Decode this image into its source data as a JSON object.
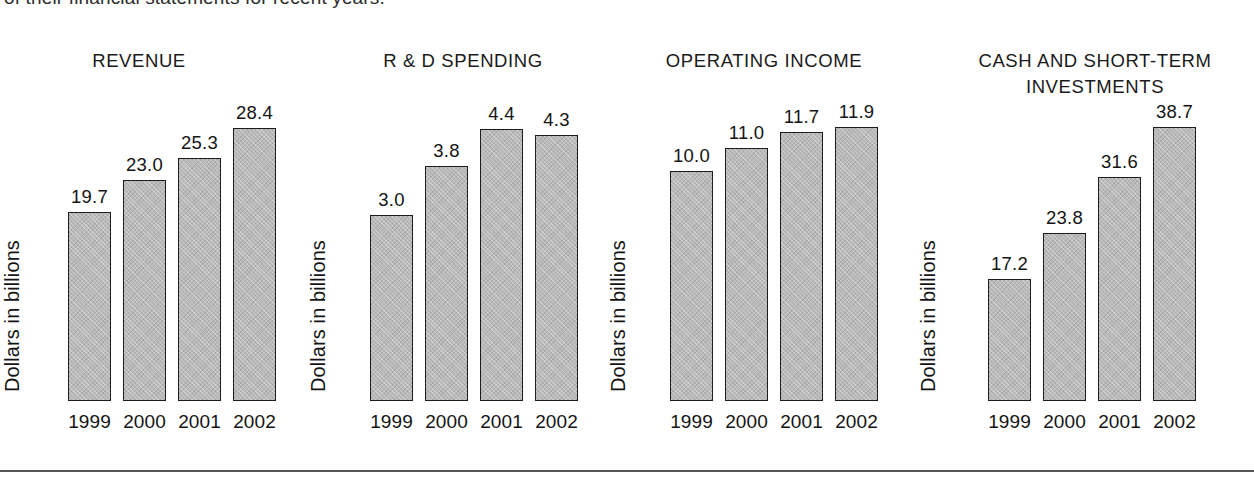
{
  "page": {
    "intro_text": "of their financial statements for recent years.",
    "bar_fill_color": "#b9b9b9",
    "bar_outline_color": "#1c1c1c",
    "background_color": "#ffffff",
    "rule_color": "#555555"
  },
  "chart_data": [
    {
      "type": "bar",
      "title": "REVENUE",
      "categories": [
        "1999",
        "2000",
        "2001",
        "2002"
      ],
      "values": [
        19.7,
        23.0,
        25.3,
        28.4
      ],
      "labels": [
        "19.7",
        "23.0",
        "25.3",
        "28.4"
      ],
      "xlabel": "",
      "ylabel": "Dollars in billions",
      "ylim": [
        0,
        33.5
      ],
      "grid": false,
      "legend": "none"
    },
    {
      "type": "bar",
      "title": "R & D SPENDING",
      "categories": [
        "1999",
        "2000",
        "2001",
        "2002"
      ],
      "values": [
        3.0,
        3.8,
        4.4,
        4.3
      ],
      "labels": [
        "3.0",
        "3.8",
        "4.4",
        "4.3"
      ],
      "xlabel": "",
      "ylabel": "Dollars in billions",
      "ylim": [
        0,
        5.2
      ],
      "grid": false,
      "legend": "none"
    },
    {
      "type": "bar",
      "title": "OPERATING INCOME",
      "categories": [
        "1999",
        "2000",
        "2001",
        "2002"
      ],
      "values": [
        10.0,
        11.0,
        11.7,
        11.9
      ],
      "labels": [
        "10.0",
        "11.0",
        "11.7",
        "11.9"
      ],
      "xlabel": "",
      "ylabel": "Dollars in billions",
      "ylim": [
        0,
        14.0
      ],
      "grid": false,
      "legend": "none"
    },
    {
      "type": "bar",
      "title": "CASH AND SHORT-TERM\nINVESTMENTS",
      "categories": [
        "1999",
        "2000",
        "2001",
        "2002"
      ],
      "values": [
        17.2,
        23.8,
        31.6,
        38.7
      ],
      "labels": [
        "17.2",
        "23.8",
        "31.6",
        "38.7"
      ],
      "xlabel": "",
      "ylabel": "Dollars in billions",
      "ylim": [
        0,
        45.5
      ],
      "grid": false,
      "legend": "none"
    }
  ]
}
